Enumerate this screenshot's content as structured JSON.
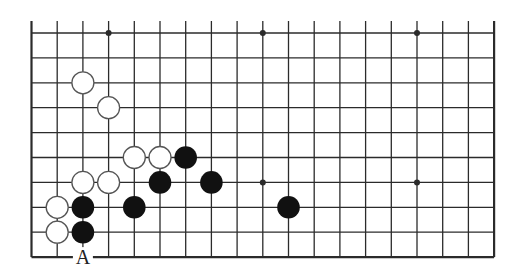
{
  "diagram": {
    "type": "go-board-diagram",
    "board_size": 19,
    "visible_columns": 19,
    "visible_rows": 10,
    "edges": {
      "left": true,
      "right": true,
      "bottom": true,
      "top": false
    },
    "colors": {
      "line": "#2b2b2b",
      "black_stone": "#111111",
      "white_stone_fill": "#ffffff",
      "white_stone_stroke": "#555555",
      "background": "#ffffff"
    },
    "star_points": [
      {
        "col": 3,
        "row": 0
      },
      {
        "col": 9,
        "row": 0
      },
      {
        "col": 15,
        "row": 0
      },
      {
        "col": 9,
        "row": 6
      },
      {
        "col": 15,
        "row": 6
      }
    ],
    "stones": [
      {
        "color": "white",
        "col": 2,
        "row": 2
      },
      {
        "color": "white",
        "col": 3,
        "row": 3
      },
      {
        "color": "white",
        "col": 4,
        "row": 5
      },
      {
        "color": "white",
        "col": 5,
        "row": 5
      },
      {
        "color": "black",
        "col": 6,
        "row": 5
      },
      {
        "color": "white",
        "col": 2,
        "row": 6
      },
      {
        "color": "white",
        "col": 3,
        "row": 6
      },
      {
        "color": "black",
        "col": 5,
        "row": 6
      },
      {
        "color": "black",
        "col": 7,
        "row": 6
      },
      {
        "color": "white",
        "col": 1,
        "row": 7
      },
      {
        "color": "black",
        "col": 2,
        "row": 7
      },
      {
        "color": "black",
        "col": 4,
        "row": 7
      },
      {
        "color": "black",
        "col": 10,
        "row": 7
      },
      {
        "color": "white",
        "col": 1,
        "row": 8
      },
      {
        "color": "black",
        "col": 2,
        "row": 8
      }
    ],
    "labels": [
      {
        "text": "A",
        "col": 2,
        "row": 9
      }
    ]
  }
}
